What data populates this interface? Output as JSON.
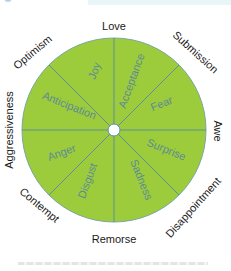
{
  "diagram": {
    "colors": {
      "fill": "#9ccc3c",
      "stroke": "#5f8f9a",
      "inner_text": "#5c8a94",
      "outer_text": "#1a1a1a",
      "center_dot": "#ffffff"
    },
    "inner_emotions": [
      {
        "label": "Joy"
      },
      {
        "label": "Acceptance"
      },
      {
        "label": "Fear"
      },
      {
        "label": "Surprise"
      },
      {
        "label": "Sadness"
      },
      {
        "label": "Disgust"
      },
      {
        "label": "Anger"
      },
      {
        "label": "Anticipation"
      }
    ],
    "outer_dyads": [
      {
        "label": "Love"
      },
      {
        "label": "Submission"
      },
      {
        "label": "Awe"
      },
      {
        "label": "Disappointment"
      },
      {
        "label": "Remorse"
      },
      {
        "label": "Contempt"
      },
      {
        "label": "Aggressiveness"
      },
      {
        "label": "Optimism"
      }
    ]
  }
}
